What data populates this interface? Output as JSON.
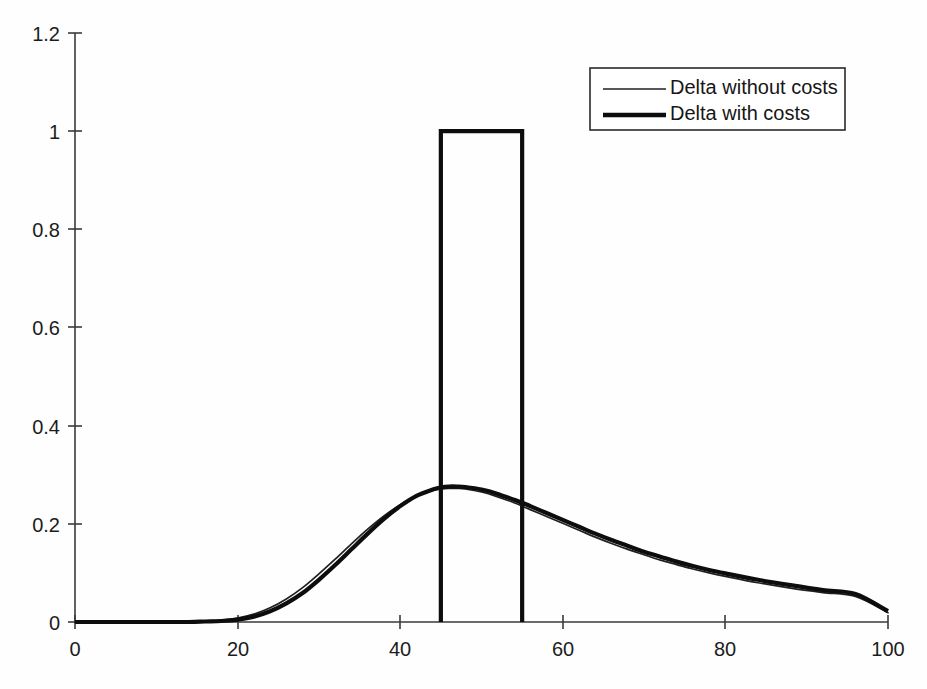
{
  "chart_data": {
    "type": "line",
    "title": "",
    "subtitle": "",
    "xlabel": "",
    "ylabel": "",
    "xlim": [
      0,
      100
    ],
    "ylim": [
      0,
      1.2
    ],
    "grid": false,
    "legend_position": "top-right",
    "xticks": [
      0,
      20,
      40,
      60,
      80,
      100
    ],
    "xtick_labels": [
      "0",
      "20",
      "40",
      "60",
      "80",
      "100"
    ],
    "yticks": [
      0,
      0.2,
      0.4,
      0.6,
      0.8,
      1,
      1.2
    ],
    "ytick_labels": [
      "0",
      "0.2",
      "0.4",
      "0.6",
      "0.8",
      "1",
      "1.2"
    ],
    "legend": [
      {
        "label": "Delta without costs",
        "style": "thin",
        "color": "#202020",
        "width": 1.7
      },
      {
        "label": "Delta with costs",
        "style": "thick",
        "color": "#0d0d0d",
        "width": 4.2
      }
    ],
    "series": [
      {
        "name": "Delta without costs",
        "style": "thin",
        "color": "#202020",
        "x": [
          0,
          5,
          10,
          14,
          16,
          18,
          20,
          22,
          24,
          26,
          28,
          30,
          32,
          34,
          36,
          38,
          40,
          42,
          44,
          45,
          46,
          47,
          48,
          50,
          52,
          54,
          55,
          56,
          58,
          60,
          62,
          64,
          66,
          68,
          70,
          72,
          74,
          76,
          78,
          80,
          84,
          88,
          92,
          96,
          100
        ],
        "y": [
          0.0,
          0.0,
          0.0,
          0.001,
          0.002,
          0.004,
          0.008,
          0.016,
          0.029,
          0.047,
          0.07,
          0.098,
          0.128,
          0.159,
          0.189,
          0.216,
          0.239,
          0.257,
          0.268,
          0.271,
          0.272,
          0.272,
          0.271,
          0.265,
          0.255,
          0.243,
          0.236,
          0.229,
          0.215,
          0.201,
          0.187,
          0.173,
          0.16,
          0.148,
          0.137,
          0.126,
          0.117,
          0.108,
          0.1,
          0.093,
          0.08,
          0.069,
          0.06,
          0.052,
          0.019
        ]
      },
      {
        "name": "Delta with costs (bell component)",
        "style": "thick",
        "color": "#0d0d0d",
        "x": [
          0,
          5,
          10,
          14,
          16,
          18,
          20,
          22,
          24,
          26,
          28,
          30,
          32,
          34,
          36,
          38,
          40,
          42,
          44,
          45,
          46,
          47,
          48,
          50,
          52,
          54,
          55,
          56,
          58,
          60,
          62,
          64,
          66,
          68,
          70,
          72,
          74,
          76,
          78,
          80,
          84,
          88,
          92,
          96,
          100
        ],
        "y": [
          0.0,
          0.0,
          0.0,
          0.0,
          0.001,
          0.002,
          0.005,
          0.011,
          0.022,
          0.038,
          0.059,
          0.086,
          0.116,
          0.148,
          0.18,
          0.21,
          0.236,
          0.257,
          0.27,
          0.274,
          0.276,
          0.276,
          0.275,
          0.27,
          0.261,
          0.249,
          0.243,
          0.236,
          0.222,
          0.208,
          0.194,
          0.18,
          0.167,
          0.155,
          0.143,
          0.133,
          0.123,
          0.114,
          0.106,
          0.099,
          0.086,
          0.075,
          0.065,
          0.057,
          0.022
        ]
      }
    ],
    "annotations": [
      {
        "type": "rectangular-pulse",
        "series": "Delta with costs",
        "x_start": 45,
        "x_end": 55,
        "height": 1.0,
        "baseline": 0.0,
        "description": "Vertical step region where delta with costs jumps to 1"
      }
    ]
  }
}
